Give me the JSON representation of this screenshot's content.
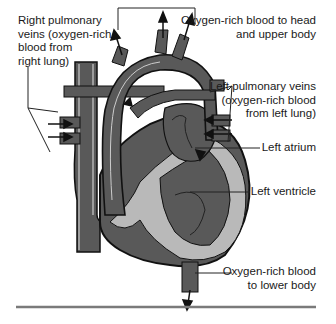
{
  "diagram": {
    "colors": {
      "vessel_dark": "#595959",
      "wall_light": "#b9b9b9",
      "outline": "#111111",
      "rule": "#7a7a7a"
    },
    "labels": {
      "right_pulmonary_veins": [
        "Right pulmonary",
        "veins (oxygen-rich",
        "blood from",
        "right lung)"
      ],
      "to_head": [
        "Oxygen-rich blood to head",
        "and upper body"
      ],
      "left_pulmonary_veins": [
        "Left pulmonary veins",
        "(oxygen-rich blood",
        "from left lung)"
      ],
      "left_atrium": [
        "Left atrium"
      ],
      "left_ventricle": [
        "Left ventricle"
      ],
      "to_lower_body": [
        "Oxygen-rich blood",
        "to lower body"
      ]
    }
  }
}
